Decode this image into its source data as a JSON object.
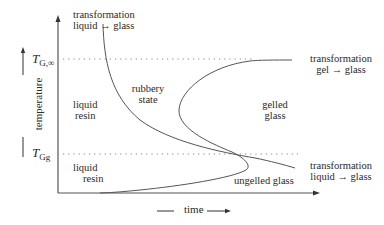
{
  "diagram": {
    "type": "TTT cure diagram",
    "axes": {
      "x_label": "time",
      "y_label": "temperature"
    },
    "temperature_levels": {
      "tg_inf": {
        "symbol": "T",
        "subscript": "G,∞"
      },
      "tg_gel": {
        "symbol": "T",
        "subscript": "Gg"
      }
    },
    "labels": {
      "top_transformation_line1": "transformation",
      "top_transformation_line2": "liquid → glass",
      "right_upper_transformation_line1": "transformation",
      "right_upper_transformation_line2": "gel → glass",
      "right_lower_transformation_line1": "transformation",
      "right_lower_transformation_line2": "liquid → glass",
      "rubbery_line1": "rubbery",
      "rubbery_line2": "state",
      "liquid_resin_upper_line1": "liquid",
      "liquid_resin_upper_line2": "resin",
      "liquid_resin_lower_line1": "liquid",
      "liquid_resin_lower_line2": "resin",
      "gelled_glass_line1": "gelled",
      "gelled_glass_line2": "glass",
      "ungelled_glass": "ungelled glass"
    },
    "regions": [
      "liquid resin",
      "rubbery state",
      "gelled glass",
      "ungelled glass"
    ],
    "curves": [
      "vitrification curve (liquid → glass)",
      "gelation curve (gel → glass)"
    ],
    "colors": {
      "line": "#555555",
      "dotted": "#777777",
      "text": "#2a2a2a"
    }
  }
}
